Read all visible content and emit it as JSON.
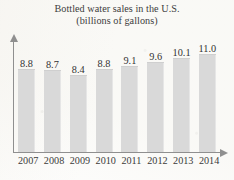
{
  "chart_data": {
    "type": "bar",
    "title": "Bottled water sales in the U.S.",
    "subtitle": "(billions of gallons)",
    "xlabel": "",
    "ylabel": "",
    "grid": false,
    "legend": false,
    "axis_arrows": true,
    "bar_color": "#d9d9d9",
    "axis_color": "#8f8f8f",
    "categories": [
      "2007",
      "2008",
      "2009",
      "2010",
      "2011",
      "2012",
      "2013",
      "2014"
    ],
    "values": [
      8.8,
      8.7,
      8.4,
      8.8,
      9.1,
      9.6,
      10.1,
      11.0
    ],
    "value_labels": [
      "8.8",
      "8.7",
      "8.4",
      "8.8",
      "9.1",
      "9.6",
      "10.1",
      "11.0"
    ],
    "ylim": [
      0,
      11.6
    ],
    "bars": [
      {
        "category": "2007",
        "value": 8.8,
        "label": "8.8",
        "height_px": 82
      },
      {
        "category": "2008",
        "value": 8.7,
        "label": "8.7",
        "height_px": 81
      },
      {
        "category": "2009",
        "value": 8.4,
        "label": "8.4",
        "height_px": 76
      },
      {
        "category": "2010",
        "value": 8.8,
        "label": "8.8",
        "height_px": 82
      },
      {
        "category": "2011",
        "value": 9.1,
        "label": "9.1",
        "height_px": 85
      },
      {
        "category": "2012",
        "value": 9.6,
        "label": "9.6",
        "height_px": 89
      },
      {
        "category": "2013",
        "value": 10.1,
        "label": "10.1",
        "height_px": 93
      },
      {
        "category": "2014",
        "value": 11.0,
        "label": "11.0",
        "height_px": 97
      }
    ]
  }
}
